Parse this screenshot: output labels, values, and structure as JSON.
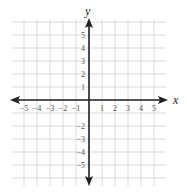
{
  "diagram": {
    "type": "coordinate-plane",
    "x_axis_label": "x",
    "y_axis_label": "y",
    "x_range": [
      -5,
      5
    ],
    "y_range": [
      -5,
      5
    ],
    "x_tick_labels": [
      "−5",
      "−4",
      "−3",
      "−2",
      "−1",
      "1",
      "2",
      "3",
      "4",
      "5"
    ],
    "y_tick_labels": [
      "5",
      "4",
      "3",
      "2",
      "1",
      "−2",
      "−3",
      "−4",
      "−5"
    ],
    "colors": {
      "grid": "#d0d0d0",
      "axis": "#222222",
      "tick_text": "#555555"
    }
  }
}
